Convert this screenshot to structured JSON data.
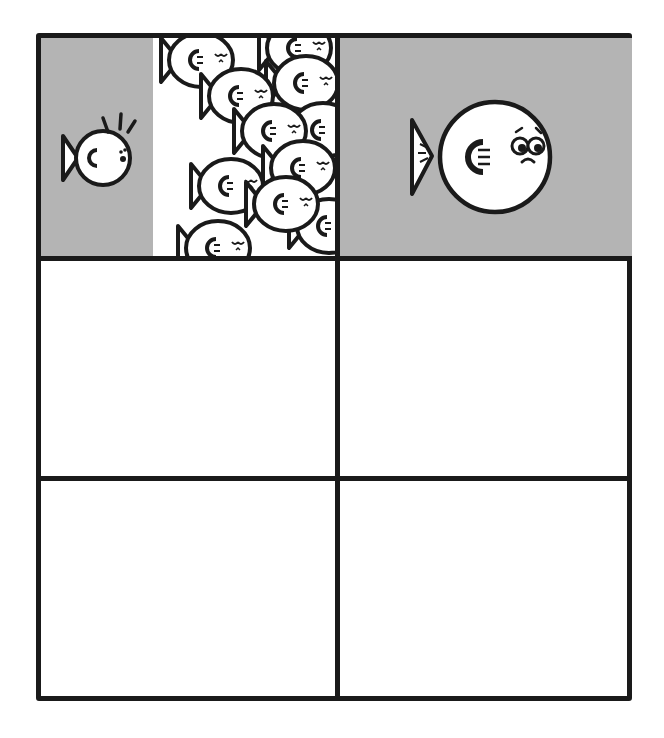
{
  "comic": {
    "layout": {
      "rows": 3,
      "columns": 2
    },
    "colors": {
      "border": "#1a1a1a",
      "shaded_panel": "#b4b4b4",
      "blank_panel": "#ffffff",
      "fish_fill": "#ffffff"
    },
    "panels": [
      {
        "id": 1,
        "row": 1,
        "col": 1,
        "shaded": true,
        "content": "small startled fish facing a wall of sleeping school fish"
      },
      {
        "id": 2,
        "row": 1,
        "col": 2,
        "shaded": true,
        "content": "single large worried fish"
      },
      {
        "id": 3,
        "row": 2,
        "col": 1,
        "shaded": false,
        "content": ""
      },
      {
        "id": 4,
        "row": 2,
        "col": 2,
        "shaded": false,
        "content": ""
      },
      {
        "id": 5,
        "row": 3,
        "col": 1,
        "shaded": false,
        "content": ""
      },
      {
        "id": 6,
        "row": 3,
        "col": 2,
        "shaded": false,
        "content": ""
      }
    ]
  }
}
